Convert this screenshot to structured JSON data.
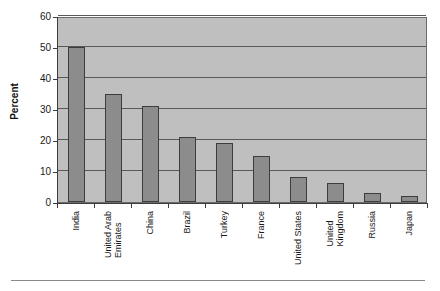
{
  "chart_data": {
    "type": "bar",
    "title": "",
    "xlabel": "",
    "ylabel": "Percent",
    "ylim": [
      0,
      60
    ],
    "ytick_step": 10,
    "ytick_labels": [
      "60",
      "50",
      "40",
      "30",
      "20",
      "10",
      "0"
    ],
    "ytick_values": [
      60,
      50,
      40,
      30,
      20,
      10,
      0
    ],
    "grid": true,
    "grid_axis": "y",
    "legend": false,
    "legend_position": "none",
    "orientation": "vertical",
    "categories": [
      "India",
      "United Arab Emirates",
      "China",
      "Brazil",
      "Turkey",
      "France",
      "United States",
      "United Kingdom",
      "Russia",
      "Japan"
    ],
    "category_lines": [
      [
        "India"
      ],
      [
        "United Arab",
        "Emirates"
      ],
      [
        "China"
      ],
      [
        "Brazil"
      ],
      [
        "Turkey"
      ],
      [
        "France"
      ],
      [
        "United States"
      ],
      [
        "United",
        "Kingdom"
      ],
      [
        "Russia"
      ],
      [
        "Japan"
      ]
    ],
    "values": [
      50,
      35,
      31,
      21,
      19,
      15,
      8,
      6,
      3,
      2
    ],
    "series": [
      {
        "name": "Percent",
        "values": [
          50,
          35,
          31,
          21,
          19,
          15,
          8,
          6,
          3,
          2
        ]
      }
    ]
  },
  "style": {
    "plot_background": "#bfbfbf",
    "bar_fill": "#8c8c8c",
    "bar_border": "#3d3d3d",
    "gridline_color": "#595959",
    "axis_color": "#3d3d3d",
    "text_color": "#1a1a1a",
    "page_background": "#ffffff",
    "rule_color": "#8a8a8a"
  }
}
